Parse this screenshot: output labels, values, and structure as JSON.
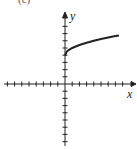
{
  "chart_data": {
    "type": "line",
    "title": "",
    "partial_label": "(c)",
    "xlabel": "x",
    "ylabel": "y",
    "xlim": [
      -8,
      8
    ],
    "ylim": [
      -8,
      8
    ],
    "grid": false,
    "tick_spacing": 1,
    "series": [
      {
        "name": "y = 4 + sqrt(x)",
        "x": [
          0,
          0.25,
          0.5,
          1,
          2,
          3,
          4,
          5,
          6,
          7,
          7.5
        ],
        "y": [
          4,
          4.5,
          4.71,
          5,
          5.41,
          5.73,
          6,
          6.24,
          6.45,
          6.65,
          6.74
        ]
      }
    ]
  }
}
